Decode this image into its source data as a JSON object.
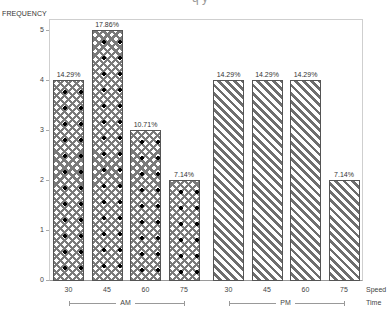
{
  "chart_data": {
    "type": "bar",
    "title": "Frequency",
    "ylabel": "FREQUENCY",
    "xlabel_levels": [
      "Speed",
      "Time"
    ],
    "ylim": [
      0,
      5
    ],
    "yticks": [
      "0",
      "1",
      "2",
      "3",
      "4",
      "5"
    ],
    "groups": [
      {
        "name": "AM",
        "pattern": "crosshatch",
        "categories": [
          "30",
          "45",
          "60",
          "75"
        ],
        "values": [
          4,
          5,
          3,
          2
        ],
        "labels": [
          "14.29%",
          "17.86%",
          "10.71%",
          "7.14%"
        ]
      },
      {
        "name": "PM",
        "pattern": "diagonal-hatch",
        "categories": [
          "30",
          "45",
          "60",
          "75"
        ],
        "values": [
          4,
          4,
          4,
          2
        ],
        "labels": [
          "14.29%",
          "14.29%",
          "14.29%",
          "7.14%"
        ]
      }
    ],
    "grid": false,
    "legend": null
  },
  "axis": {
    "ylabel": "FREQUENCY",
    "speed_label": "Speed",
    "time_label": "Time",
    "title_fragment": "q   y"
  }
}
